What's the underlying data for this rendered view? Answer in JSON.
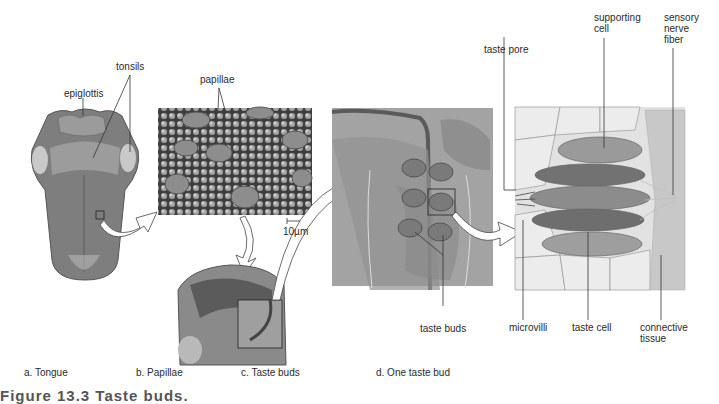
{
  "panels": {
    "a": {
      "caption": "a. Tongue",
      "labels": {
        "epiglottis": "epiglottis",
        "tonsils": "tonsils"
      }
    },
    "b": {
      "caption": "b. Papillae",
      "labels": {
        "papillae": "papillae",
        "scale": "10µm"
      }
    },
    "c": {
      "caption": "c. Taste buds",
      "labels": {
        "taste_buds": "taste buds"
      }
    },
    "d": {
      "caption": "d. One taste bud",
      "labels": {
        "taste_pore": "taste pore",
        "supporting_cell": "supporting\ncell",
        "sensory_nerve_fiber": "sensory\nnerve\nfiber",
        "microvilli": "microvilli",
        "taste_cell": "taste cell",
        "connective_tissue": "connective\ntissue"
      }
    }
  },
  "figure_caption": "Figure 13.3  Taste buds.",
  "colors": {
    "tissue_dark": "#6f6f6f",
    "tissue_mid": "#9a9a9a",
    "tissue_light": "#d6d6d6",
    "background": "#ffffff"
  }
}
